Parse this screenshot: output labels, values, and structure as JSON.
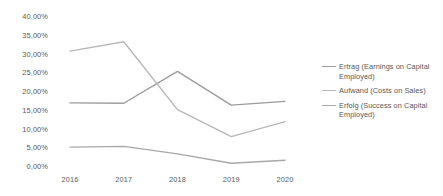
{
  "chart_data": {
    "type": "line",
    "title": "",
    "subtitle": "",
    "xlabel": "",
    "ylabel": "",
    "categories": [
      "2016",
      "2017",
      "2018",
      "2019",
      "2020"
    ],
    "x": [
      2016,
      2017,
      2018,
      2019,
      2020
    ],
    "ylim": [
      0,
      40
    ],
    "ytick_values": [
      0,
      5,
      10,
      15,
      20,
      25,
      30,
      35,
      40
    ],
    "ytick_labels": [
      "0,00%",
      "5,00%",
      "10,00%",
      "15,00%",
      "20,00%",
      "25,00%",
      "30,00%",
      "35,00%",
      "40,00%"
    ],
    "grid": false,
    "axis_lines": false,
    "markers": false,
    "legend_position": "right",
    "value_suffix": "%",
    "decimal_separator": ",",
    "series": [
      {
        "name": "Ertrag (Earnings on Capital Employed)",
        "color": "#9c9c9c",
        "values": [
          17.1,
          17.0,
          25.5,
          16.5,
          17.5
        ]
      },
      {
        "name": "Aufwand (Costs on Sales)",
        "color": "#b8b8b8",
        "values": [
          30.9,
          33.4,
          15.3,
          8.1,
          12.1
        ]
      },
      {
        "name": "Erfolg (Success on Capital Employed)",
        "color": "#a8a8a8",
        "values": [
          5.3,
          5.5,
          3.5,
          1.0,
          1.8
        ]
      }
    ]
  },
  "axes": {
    "y_ticks": [
      {
        "label": "40,00%",
        "value": 40
      },
      {
        "label": "35,00%",
        "value": 35
      },
      {
        "label": "30,00%",
        "value": 30
      },
      {
        "label": "25,00%",
        "value": 25
      },
      {
        "label": "20,00%",
        "value": 20
      },
      {
        "label": "15,00%",
        "value": 15
      },
      {
        "label": "10,00%",
        "value": 10
      },
      {
        "label": "5,00%",
        "value": 5
      },
      {
        "label": "0,00%",
        "value": 0
      }
    ],
    "x_ticks": [
      {
        "label": "2016"
      },
      {
        "label": "2017"
      },
      {
        "label": "2018"
      },
      {
        "label": "2019"
      },
      {
        "label": "2020"
      }
    ]
  },
  "legend": {
    "entries": [
      {
        "label": "Ertrag (Earnings on Capital Employed)",
        "color": "#9c9c9c"
      },
      {
        "label": "Aufwand (Costs on Sales)",
        "color": "#b8b8b8"
      },
      {
        "label": "Erfolg (Success on Capital Employed)",
        "color": "#a8a8a8"
      }
    ]
  },
  "colors": {
    "background": "#ffffff",
    "text": "#595959",
    "series_1": "#9c9c9c",
    "series_2": "#b8b8b8",
    "series_3": "#a8a8a8"
  }
}
